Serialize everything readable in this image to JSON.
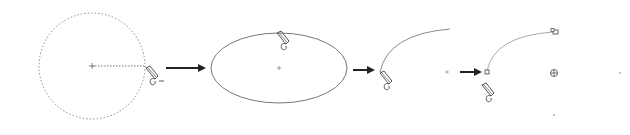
{
  "diagram": {
    "type": "cad-drawing-sequence",
    "colors": {
      "background": "#ffffff",
      "stroke": "#777777",
      "dotted": "#8a8a8a",
      "arrow": "#222222",
      "pencil": "#555555",
      "grip": "#666666"
    },
    "steps": [
      {
        "id": "circle",
        "shape": "dotted-circle",
        "center": [
          92,
          66
        ],
        "radius": 53,
        "radius_line": {
          "from": [
            92,
            66
          ],
          "to": [
            145,
            66
          ]
        },
        "cursor": "pencil-icon",
        "cursor_pos": [
          146,
          70
        ],
        "cursor_suffix": "–"
      },
      {
        "id": "ellipse",
        "shape": "ellipse",
        "center": [
          279,
          68
        ],
        "rx": 68,
        "ry": 35,
        "cursor": "pencil-icon",
        "cursor_pos": [
          278,
          33
        ]
      },
      {
        "id": "arc",
        "shape": "arc",
        "start": [
          380,
          72
        ],
        "end": [
          450,
          29
        ],
        "center_mark": [
          447,
          72
        ],
        "cursor": "pencil-icon",
        "cursor_pos": [
          381,
          73
        ]
      },
      {
        "id": "arc-grips",
        "shape": "arc-with-grips",
        "start": [
          487,
          73
        ],
        "end": [
          555,
          32
        ],
        "center_grip": [
          554,
          73
        ],
        "extra_points": [
          [
            620,
            73
          ],
          [
            554,
            115
          ]
        ],
        "cursor": "pencil-icon",
        "cursor_pos": [
          484,
          86
        ]
      }
    ],
    "arrows": [
      {
        "from": [
          166,
          68
        ],
        "to": [
          206,
          68
        ]
      },
      {
        "from": [
          353,
          70
        ],
        "to": [
          375,
          70
        ]
      },
      {
        "from": [
          460,
          72
        ],
        "to": [
          482,
          72
        ]
      }
    ]
  }
}
